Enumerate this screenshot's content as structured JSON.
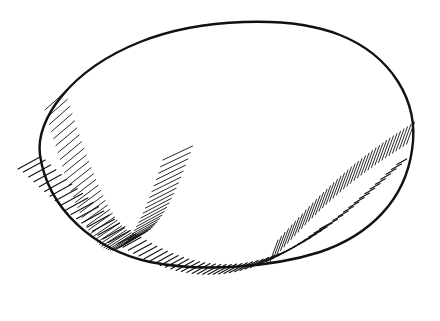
{
  "illustration": {
    "subject": "egg-shaped stone",
    "style": "pen-and-ink line drawing with hatching",
    "width": 440,
    "height": 321,
    "colors": {
      "background": "#ffffff",
      "ink": "#111111"
    },
    "outline": {
      "cx": 228,
      "cy": 150,
      "rx": 186,
      "ry": 124,
      "rotate": -4
    },
    "shadow_hatch": {
      "count": 70,
      "start_x": 28,
      "end_x": 400,
      "description": "diagonal cast-shadow strokes under the stone"
    },
    "body_hatch_left": {
      "count": 55
    },
    "body_hatch_right": {
      "count": 40
    }
  }
}
